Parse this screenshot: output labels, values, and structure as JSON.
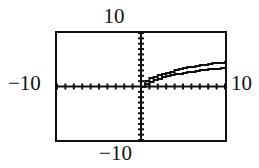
{
  "figure": {
    "kind": "graphing-calculator-screen"
  },
  "labels": {
    "top": "10",
    "bottom": "−10",
    "left": "−10",
    "right": "10"
  },
  "colors": {
    "ink": "#111111",
    "background": "#ffffff"
  },
  "chart_data": {
    "type": "line",
    "title": "",
    "xlabel": "",
    "ylabel": "",
    "xlim": [
      -10,
      10
    ],
    "ylim": [
      -10,
      10
    ],
    "xscl": 1,
    "yscl": 1,
    "grid": false,
    "axes": {
      "x_axis_ticks_labeled": [
        "-10",
        "10"
      ],
      "y_axis_ticks_labeled": [
        "-10",
        "10"
      ],
      "tick_marks": "unit tick marks along both axes"
    },
    "legend": "none",
    "series": [
      {
        "name": "upper curve",
        "x": [
          0,
          0.5,
          1,
          1.5,
          2,
          2.5,
          3,
          3.5,
          4,
          4.5,
          5,
          5.5,
          6,
          6.5,
          7,
          7.5,
          8,
          8.5,
          9,
          9.5,
          10
        ],
        "values": [
          0.0,
          1.0,
          1.5,
          1.8,
          2.1,
          2.4,
          2.6,
          2.8,
          3.0,
          3.2,
          3.4,
          3.6,
          3.7,
          3.9,
          4.0,
          4.1,
          4.2,
          4.3,
          4.4,
          4.45,
          4.5
        ]
      },
      {
        "name": "lower curve",
        "x": [
          0,
          0.5,
          1,
          1.5,
          2,
          2.5,
          3,
          3.5,
          4,
          4.5,
          5,
          5.5,
          6,
          6.5,
          7,
          7.5,
          8,
          8.5,
          9,
          9.5,
          10
        ],
        "values": [
          0.0,
          0.55,
          0.9,
          1.2,
          1.45,
          1.7,
          1.9,
          2.1,
          2.25,
          2.4,
          2.55,
          2.7,
          2.8,
          2.95,
          3.05,
          3.15,
          3.2,
          3.3,
          3.35,
          3.4,
          3.4
        ]
      }
    ]
  }
}
